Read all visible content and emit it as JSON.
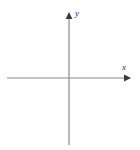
{
  "figure": {
    "background_color": "#ffffff",
    "width": 140,
    "height": 150
  },
  "axes": {
    "x_axis": {
      "name": "x-axis",
      "label": "x",
      "color": "#8a8a8a",
      "stroke_width": 1.2,
      "start_x": 7,
      "end_x": 131,
      "y": 78,
      "arrow_at": "end",
      "arrow_color": "#3a3a3a"
    },
    "y_axis": {
      "name": "y-axis",
      "label": "y",
      "color": "#8a8a8a",
      "stroke_width": 1.2,
      "start_y": 145,
      "end_y": 13,
      "x": 69,
      "arrow_at": "top",
      "arrow_color": "#3a3a3a"
    },
    "origin": {
      "label": "",
      "x": 69,
      "y": 78
    }
  },
  "chart_data": {
    "type": "line",
    "title": "",
    "subtitle": "",
    "xlabel": "x",
    "ylabel": "y",
    "series": [],
    "categories": [],
    "values": [],
    "xlim": [
      -62,
      62
    ],
    "ylim": [
      -67,
      65
    ],
    "xticks": [],
    "yticks": [],
    "xticklabels": [],
    "yticklabels": [],
    "grid": false,
    "legend": false,
    "legend_position": "none",
    "annotations": [
      {
        "text": "y",
        "x": 75,
        "y": 9,
        "style": "italic"
      },
      {
        "text": "x",
        "x": 122,
        "y": 63,
        "style": "italic"
      }
    ],
    "axis_arrows": {
      "x_positive": true,
      "y_positive": true,
      "x_negative": false,
      "y_negative": false
    }
  }
}
